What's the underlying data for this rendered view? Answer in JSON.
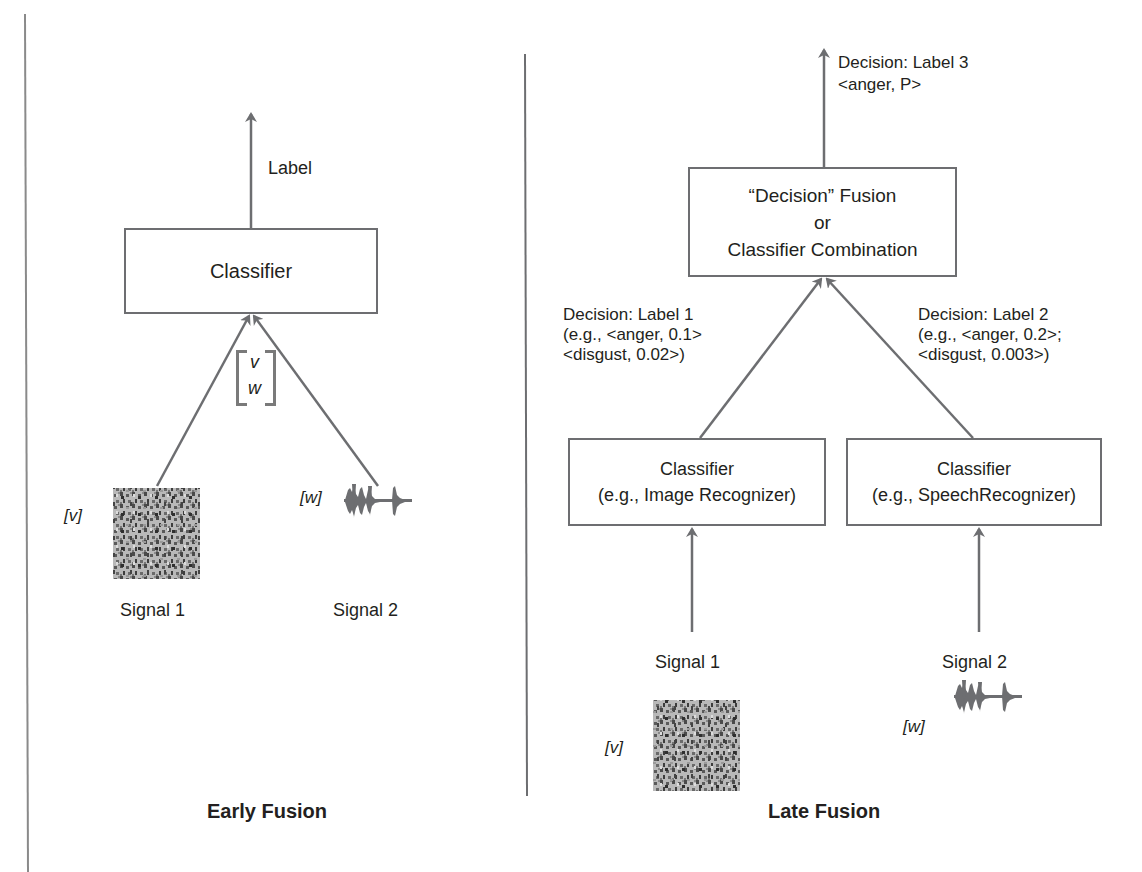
{
  "early_fusion": {
    "title": "Early Fusion",
    "output_label": "Label",
    "classifier_label": "Classifier",
    "feature_vector": {
      "top": "v",
      "bottom": "w"
    },
    "signals": [
      {
        "name": "Signal 1",
        "tag": "[v]",
        "type": "image"
      },
      {
        "name": "Signal 2",
        "tag": "[w]",
        "type": "audio-waveform"
      }
    ]
  },
  "late_fusion": {
    "title": "Late Fusion",
    "fusion_box": {
      "line1": "“Decision” Fusion",
      "line2": "or",
      "line3": "Classifier Combination"
    },
    "final_decision": {
      "line1": "Decision: Label 3",
      "line2": "<anger, P>"
    },
    "decisions": [
      {
        "line1": "Decision: Label 1",
        "line2": "(e.g., <anger, 0.1>",
        "line3": "<disgust, 0.02>)"
      },
      {
        "line1": "Decision: Label 2",
        "line2": "(e.g., <anger, 0.2>;",
        "line3": "<disgust, 0.003>)"
      }
    ],
    "classifiers": [
      {
        "line1": "Classifier",
        "line2": "(e.g., Image Recognizer)"
      },
      {
        "line1": "Classifier",
        "line2": "(e.g., SpeechRecognizer)"
      }
    ],
    "signals": [
      {
        "name": "Signal 1",
        "tag": "[v]",
        "type": "image"
      },
      {
        "name": "Signal 2",
        "tag": "[w]",
        "type": "audio-waveform"
      }
    ]
  },
  "colors": {
    "line": "#6d6e71",
    "text": "#231f20",
    "divider": "#808080"
  }
}
